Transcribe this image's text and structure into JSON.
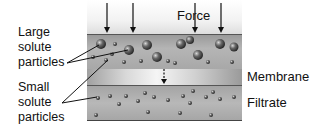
{
  "diagram": {
    "force_label": "Force",
    "labels": {
      "large": [
        "Large",
        "solute",
        "particles"
      ],
      "small": [
        "Small",
        "solute",
        "particles"
      ],
      "membrane": "Membrane",
      "filtrate": "Filtrate"
    },
    "colors": {
      "particle_dark": "#3a3a3a",
      "particle_light": "#bdbdbd",
      "line": "#111111"
    },
    "force_arrows_x": [
      107,
      133,
      195,
      221
    ],
    "large_particles": [
      [
        101,
        44,
        5
      ],
      [
        147,
        45,
        5
      ],
      [
        129,
        50,
        5
      ],
      [
        157,
        57,
        5
      ],
      [
        181,
        44,
        5
      ],
      [
        198,
        55,
        5
      ],
      [
        220,
        44,
        5
      ],
      [
        234,
        47,
        4.5
      ],
      [
        190,
        40,
        4
      ]
    ],
    "small_particles": [
      [
        115,
        44
      ],
      [
        93,
        57
      ],
      [
        106,
        60
      ],
      [
        124,
        62
      ],
      [
        141,
        61
      ],
      [
        168,
        61
      ],
      [
        175,
        63
      ],
      [
        208,
        62
      ],
      [
        232,
        62
      ],
      [
        112,
        54
      ],
      [
        98,
        98
      ],
      [
        119,
        104
      ],
      [
        126,
        96
      ],
      [
        138,
        101
      ],
      [
        145,
        93
      ],
      [
        154,
        97
      ],
      [
        168,
        100
      ],
      [
        183,
        96
      ],
      [
        190,
        103
      ],
      [
        193,
        91
      ],
      [
        206,
        97
      ],
      [
        213,
        92
      ],
      [
        220,
        99
      ],
      [
        234,
        97
      ],
      [
        96,
        115
      ],
      [
        148,
        112
      ],
      [
        180,
        113
      ],
      [
        211,
        115
      ],
      [
        110,
        96
      ]
    ]
  }
}
